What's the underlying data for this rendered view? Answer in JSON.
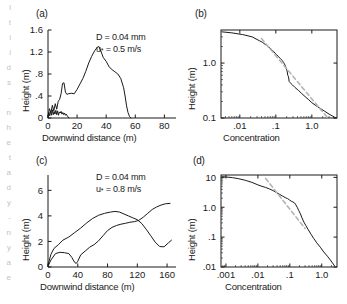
{
  "figure": {
    "background": "#ffffff",
    "line_color": "#1a1a1a",
    "dash_color": "#b4b4b4",
    "axis_color": "#1a1a1a"
  },
  "edge_artifact": {
    "lines": [
      "l",
      "t",
      "i",
      "i",
      "d",
      "s",
      "-",
      "n",
      "h",
      "e",
      "t",
      "a",
      "d",
      "y",
      "-",
      "n",
      "y",
      "a",
      "e"
    ]
  },
  "panels": [
    {
      "key": "a",
      "label": "(a)",
      "annotation_line1": "D = 0.04 mm",
      "annotation_line2_pre": "u",
      "annotation_line2_sub": "*",
      "annotation_line2_post": " = 0.5 m/s",
      "xlabel": "Downwind distance (m)",
      "ylabel": "Height (m)"
    },
    {
      "key": "b",
      "label": "(b)",
      "xlabel": "Concentration",
      "ylabel": "Height (m)"
    },
    {
      "key": "c",
      "label": "(c)",
      "annotation_line1": "D = 0.04 mm",
      "annotation_line2_pre": "u",
      "annotation_line2_sub": "*",
      "annotation_line2_post": " = 0.8 m/s",
      "xlabel": "Downwind distance (m)",
      "ylabel": "Height (m)"
    },
    {
      "key": "d",
      "label": "(d)",
      "xlabel": "Concentration",
      "ylabel": "Height (m)"
    }
  ],
  "chart_data": [
    {
      "id": "panel-a",
      "type": "line",
      "title": "(a)",
      "xlabel": "Downwind distance (m)",
      "ylabel": "Height (m)",
      "xscale": "linear",
      "yscale": "linear",
      "xlim": [
        0,
        88
      ],
      "ylim": [
        0,
        1.6
      ],
      "xticks": [
        0,
        20,
        40,
        60,
        80
      ],
      "xticklabels": [
        "0",
        "20",
        "40",
        "60",
        "80"
      ],
      "yticks": [
        0,
        0.4,
        0.8,
        1.2,
        1.6
      ],
      "yticklabels": [
        "0",
        ".4",
        ".8",
        "1.2",
        "1.6"
      ],
      "grid": false,
      "legend": null,
      "annotations": [
        "D = 0.04 mm",
        "u* = 0.5 m/s"
      ],
      "series": [
        {
          "name": "saltation-cloud-envelope",
          "style": "solid",
          "color": "#1a1a1a",
          "x": [
            0,
            1,
            2,
            3,
            4,
            5,
            6,
            7,
            8,
            9,
            10,
            11,
            12,
            13,
            14,
            16,
            18,
            20,
            22,
            24,
            26,
            28,
            30,
            32,
            34,
            35,
            36,
            38,
            40,
            42,
            44,
            46,
            48,
            50,
            52,
            53,
            54,
            55,
            56,
            57
          ],
          "y": [
            0.02,
            0.17,
            0.1,
            0.23,
            0.13,
            0.26,
            0.16,
            0.3,
            0.34,
            0.44,
            0.63,
            0.64,
            0.47,
            0.43,
            0.44,
            0.45,
            0.44,
            0.52,
            0.62,
            0.72,
            0.85,
            1.0,
            1.12,
            1.22,
            1.29,
            1.3,
            1.24,
            1.1,
            1.03,
            0.93,
            0.88,
            0.84,
            0.8,
            0.72,
            0.55,
            0.4,
            0.22,
            0.1,
            0.03,
            0.0
          ]
        },
        {
          "name": "near-surface-noise",
          "style": "solid",
          "color": "#1a1a1a",
          "x": [
            0,
            0.6,
            1.2,
            1.8,
            2.4,
            3.0,
            3.6,
            4.2,
            4.8,
            5.4,
            6.0,
            6.6,
            7.2,
            7.8,
            8.4,
            9.0,
            9.6,
            10.2,
            10.8,
            11.4,
            12.0,
            12.6,
            13.2,
            13.8,
            14.4
          ],
          "y": [
            0.0,
            0.1,
            0.04,
            0.13,
            0.05,
            0.15,
            0.06,
            0.12,
            0.07,
            0.14,
            0.06,
            0.13,
            0.05,
            0.11,
            0.09,
            0.12,
            0.07,
            0.1,
            0.06,
            0.09,
            0.05,
            0.07,
            0.04,
            0.02,
            0.0
          ]
        }
      ]
    },
    {
      "id": "panel-b",
      "type": "line",
      "title": "(b)",
      "xlabel": "Concentration",
      "ylabel": "Height (m)",
      "xscale": "log",
      "yscale": "log",
      "xlim": [
        0.003,
        5.0
      ],
      "ylim": [
        0.1,
        4.0
      ],
      "xticks": [
        0.01,
        0.1,
        1.0
      ],
      "xticklabels": [
        ".01",
        ".1",
        "1.0"
      ],
      "yticks": [
        0.1,
        1.0
      ],
      "yticklabels": [
        "0.1",
        "1.0"
      ],
      "grid": false,
      "legend": null,
      "series": [
        {
          "name": "measured-concentration-profile",
          "style": "solid",
          "color": "#1a1a1a",
          "x": [
            0.0032,
            0.006,
            0.012,
            0.022,
            0.035,
            0.042,
            0.055,
            0.07,
            0.08,
            0.095,
            0.105,
            0.12,
            0.135,
            0.15,
            0.165,
            0.18,
            0.195,
            0.205,
            0.215,
            0.225,
            0.235,
            0.25,
            0.29,
            0.34,
            0.42,
            0.52,
            0.65,
            0.82,
            1.0,
            1.3,
            1.7,
            2.3,
            3.0,
            3.8,
            4.6
          ],
          "y": [
            3.7,
            3.55,
            3.3,
            3.0,
            2.55,
            2.4,
            2.1,
            1.85,
            1.72,
            1.52,
            1.42,
            1.3,
            1.2,
            1.12,
            1.02,
            0.92,
            0.8,
            0.72,
            0.6,
            0.56,
            0.46,
            0.44,
            0.4,
            0.36,
            0.32,
            0.28,
            0.245,
            0.215,
            0.19,
            0.168,
            0.15,
            0.132,
            0.118,
            0.108,
            0.1
          ]
        },
        {
          "name": "power-law-reference",
          "style": "dashed",
          "color": "#b4b4b4",
          "x": [
            0.04,
            2.6
          ],
          "y": [
            2.8,
            0.105
          ]
        }
      ]
    },
    {
      "id": "panel-c",
      "type": "line",
      "title": "(c)",
      "xlabel": "Downwind distance (m)",
      "ylabel": "Height (m)",
      "xscale": "linear",
      "yscale": "linear",
      "xlim": [
        0,
        172
      ],
      "ylim": [
        0,
        7.2
      ],
      "xticks": [
        0,
        40,
        80,
        120,
        160
      ],
      "xticklabels": [
        "0",
        "40",
        "80",
        "120",
        "160"
      ],
      "yticks": [
        0,
        2,
        4,
        6
      ],
      "yticklabels": [
        "0",
        "2",
        "4",
        "6"
      ],
      "grid": false,
      "legend": null,
      "annotations": [
        "D = 0.04 mm",
        "u* = 0.8 m/s"
      ],
      "series": [
        {
          "name": "upper-envelope-curve",
          "style": "solid",
          "color": "#1a1a1a",
          "x": [
            0,
            4,
            8,
            14,
            20,
            28,
            36,
            44,
            52,
            60,
            68,
            76,
            84,
            90,
            96,
            102,
            108,
            114,
            120,
            126,
            132,
            138,
            144,
            150,
            156,
            162,
            166
          ],
          "y": [
            0.15,
            1.0,
            1.45,
            1.75,
            2.1,
            2.35,
            2.7,
            3.05,
            3.45,
            3.8,
            4.05,
            4.2,
            4.3,
            4.35,
            4.3,
            4.15,
            4.0,
            3.85,
            3.7,
            3.4,
            2.95,
            2.45,
            1.95,
            1.6,
            1.58,
            1.9,
            2.1
          ]
        },
        {
          "name": "lower-envelope-curve",
          "style": "solid",
          "color": "#1a1a1a",
          "x": [
            0,
            4,
            10,
            16,
            22,
            28,
            32,
            36,
            38,
            40,
            44,
            50,
            56,
            62,
            68,
            74,
            80,
            86,
            92,
            98,
            104,
            110,
            116,
            122,
            128,
            134,
            140,
            146,
            152,
            158,
            164
          ],
          "y": [
            0.05,
            0.55,
            1.05,
            1.15,
            1.12,
            1.05,
            0.75,
            0.35,
            0.28,
            0.45,
            0.95,
            1.25,
            1.55,
            1.75,
            2.05,
            2.45,
            2.85,
            3.1,
            3.25,
            3.35,
            3.42,
            3.5,
            3.55,
            3.65,
            3.9,
            4.2,
            4.5,
            4.7,
            4.85,
            4.95,
            4.98
          ]
        }
      ]
    },
    {
      "id": "panel-d",
      "type": "line",
      "title": "(d)",
      "xlabel": "Concentration",
      "ylabel": "Height (m)",
      "xscale": "log",
      "yscale": "log",
      "xlim": [
        0.0007,
        3.0
      ],
      "ylim": [
        0.01,
        12.0
      ],
      "xticks": [
        0.001,
        0.01,
        0.1,
        1.0
      ],
      "xticklabels": [
        ".001",
        ".01",
        ".1",
        "1.0"
      ],
      "yticks": [
        0.01,
        0.1,
        1.0,
        10.0
      ],
      "yticklabels": [
        ".01",
        ".1",
        "1.0",
        "10"
      ],
      "grid": false,
      "legend": null,
      "series": [
        {
          "name": "measured-concentration-profile",
          "style": "solid",
          "color": "#1a1a1a",
          "x": [
            0.00075,
            0.001,
            0.0016,
            0.0025,
            0.004,
            0.0065,
            0.01,
            0.0135,
            0.0175,
            0.023,
            0.03,
            0.038,
            0.048,
            0.06,
            0.072,
            0.085,
            0.098,
            0.11,
            0.125,
            0.14,
            0.155,
            0.17,
            0.19,
            0.215,
            0.24,
            0.275,
            0.32,
            0.38,
            0.46,
            0.56,
            0.7,
            0.9,
            1.15,
            1.5,
            1.95,
            2.5
          ],
          "y": [
            10.5,
            10.3,
            9.8,
            9.0,
            8.0,
            6.8,
            5.6,
            5.0,
            4.6,
            4.1,
            3.6,
            3.1,
            2.7,
            2.35,
            2.1,
            1.95,
            1.75,
            1.6,
            1.5,
            1.4,
            1.2,
            1.0,
            0.78,
            0.6,
            0.44,
            0.32,
            0.24,
            0.175,
            0.125,
            0.09,
            0.064,
            0.046,
            0.032,
            0.023,
            0.016,
            0.011
          ]
        },
        {
          "name": "power-law-reference",
          "style": "dashed",
          "color": "#b4b4b4",
          "x": [
            0.0175,
            0.3
          ],
          "y": [
            9.2,
            0.195
          ]
        }
      ]
    }
  ]
}
